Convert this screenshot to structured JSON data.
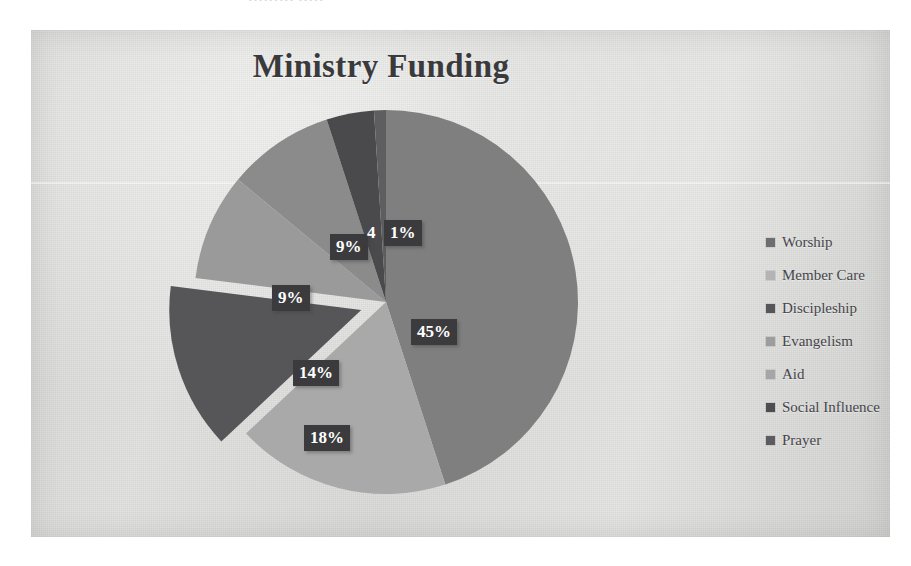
{
  "scan": {
    "top_fragment": "••••••••• •••••"
  },
  "chart_data": {
    "type": "pie",
    "title": "Ministry Funding",
    "xlabel": "",
    "ylabel": "",
    "grid": false,
    "legend_position": "right",
    "exploded_slices": [
      "Discipleship"
    ],
    "start_angle_deg": 0,
    "direction": "clockwise",
    "categories": [
      "Worship",
      "Member Care",
      "Discipleship",
      "Evangelism",
      "Aid",
      "Social Influence",
      "Prayer"
    ],
    "values": [
      45,
      18,
      14,
      9,
      9,
      4,
      1
    ],
    "value_unit": "%",
    "data_labels": [
      "45%",
      "18%",
      "14%",
      "9%",
      "9%",
      "4",
      "1%"
    ],
    "colors": [
      "#7f7f7f",
      "#a9a9a9",
      "#565658",
      "#9a9a9a",
      "#8b8b8b",
      "#4a4a4c",
      "#5e5e60"
    ],
    "slices": [
      {
        "label": "Worship",
        "value": 45,
        "data_label": "45%",
        "color": "#7f7f7f"
      },
      {
        "label": "Member Care",
        "value": 18,
        "data_label": "18%",
        "color": "#a9a9a9"
      },
      {
        "label": "Discipleship",
        "value": 14,
        "data_label": "14%",
        "color": "#565658"
      },
      {
        "label": "Evangelism",
        "value": 9,
        "data_label": "9%",
        "color": "#9a9a9a"
      },
      {
        "label": "Aid",
        "value": 9,
        "data_label": "9%",
        "color": "#8b8b8b"
      },
      {
        "label": "Social Influence",
        "value": 4,
        "data_label": "4",
        "color": "#4a4a4c"
      },
      {
        "label": "Prayer",
        "value": 1,
        "data_label": "1%",
        "color": "#5e5e60"
      }
    ]
  },
  "legend": {
    "items": [
      {
        "label": "Worship",
        "swatch_color": "#6e6e70",
        "marker": "square-marker"
      },
      {
        "label": "Member Care",
        "swatch_color": "#b4b4b4",
        "marker": "square-marker"
      },
      {
        "label": "Discipleship",
        "swatch_color": "#56565a",
        "marker": "square-marker"
      },
      {
        "label": "Evangelism",
        "swatch_color": "#9d9d9f",
        "marker": "square-marker"
      },
      {
        "label": "Aid",
        "swatch_color": "#a6a6a8",
        "marker": "square-marker"
      },
      {
        "label": "Social Influence",
        "swatch_color": "#4e4e52",
        "marker": "square-marker"
      },
      {
        "label": "Prayer",
        "swatch_color": "#5c5c60",
        "marker": "square-marker"
      }
    ]
  }
}
